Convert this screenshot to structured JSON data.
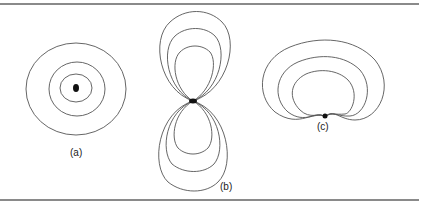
{
  "figure": {
    "panels": [
      {
        "id": "a",
        "label": "(a)",
        "description": "concentric closed curves around a central point"
      },
      {
        "id": "b",
        "label": "(b)",
        "description": "figure-eight lobes above and below a central point"
      },
      {
        "id": "c",
        "label": "(c)",
        "description": "nested cardioid-shaped curves opening downward to a point"
      }
    ],
    "line_color": "#555555",
    "dot_color": "#111111",
    "rule_color": "#8a8a8a"
  }
}
